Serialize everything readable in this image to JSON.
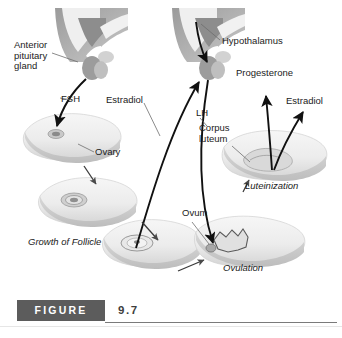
{
  "figure": {
    "label": "FIGURE",
    "number": "9.7"
  },
  "diagram": {
    "labels": [
      {
        "id": "anterior-pituitary-gland",
        "text": "Anterior\npituitary\ngland",
        "x": 14,
        "y": 40,
        "italic": false
      },
      {
        "id": "fsh",
        "text": "FSH",
        "x": 61,
        "y": 94,
        "italic": false
      },
      {
        "id": "ovary",
        "text": "Ovary",
        "x": 95,
        "y": 152,
        "italic": false
      },
      {
        "id": "growth-of-follicle",
        "text": "Growth of Follicle",
        "x": 28,
        "y": 242,
        "italic": true
      },
      {
        "id": "estradiol-left",
        "text": "Estradiol",
        "x": 110,
        "y": 95,
        "italic": false
      },
      {
        "id": "hypothalamus",
        "text": "Hypothalamus",
        "x": 222,
        "y": 38,
        "italic": false
      },
      {
        "id": "lh",
        "text": "LH",
        "x": 196,
        "y": 113,
        "italic": false
      },
      {
        "id": "corpus-luteum",
        "text": "Corpus\nluteum",
        "x": 199,
        "y": 128,
        "italic": false
      },
      {
        "id": "progesterone",
        "text": "Progesterone",
        "x": 236,
        "y": 71,
        "italic": false
      },
      {
        "id": "estradiol-right",
        "text": "Estradiol",
        "x": 286,
        "y": 99,
        "italic": false
      },
      {
        "id": "ovum",
        "text": "Ovum",
        "x": 182,
        "y": 211,
        "italic": false
      },
      {
        "id": "ovulation",
        "text": "Ovulation",
        "x": 223,
        "y": 268,
        "italic": true
      },
      {
        "id": "luteinization",
        "text": "Luteinization",
        "x": 245,
        "y": 186,
        "italic": true
      }
    ],
    "colors": {
      "ink": "#1b1b1b",
      "arrow": "#111111",
      "leader": "#6d6d6d",
      "ovary_fill": "#efefef",
      "ovary_shade": "#cfcfcf",
      "brain_dark": "#8f8f8f",
      "brain_light": "#e2e2e2",
      "figure_box": "#5c5c5c",
      "rule": "#7a7a7a",
      "background": "#ffffff"
    }
  }
}
